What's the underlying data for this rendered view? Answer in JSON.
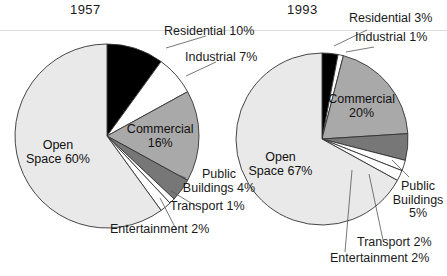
{
  "figure": {
    "background_color": "#ffffff",
    "text_color": "#1a1a1a"
  },
  "palette": {
    "residential": "#000000",
    "industrial": "#ffffff",
    "commercial": "#a9a9a9",
    "public_buildings": "#777777",
    "transport": "#ffffff",
    "entertainment": "#ffffff",
    "open_space": "#e9e9e9",
    "outline": "#333333"
  },
  "charts": {
    "left": {
      "title": "1957",
      "inner_labels": {
        "open_space_line1": "Open",
        "open_space_line2": "Space 60%",
        "commercial_line1": "Commercial",
        "commercial_line2": "16%"
      },
      "callouts": {
        "residential": "Residential 10%",
        "industrial": "Industrial 7%",
        "public_buildings_line1": "Public",
        "public_buildings_line2": "Buildings 4%",
        "transport": "Transport 1%",
        "entertainment": "Entertainment 2%"
      }
    },
    "right": {
      "title": "1993",
      "inner_labels": {
        "open_space_line1": "Open",
        "open_space_line2": "Space 67%",
        "commercial_line1": "Commercial",
        "commercial_line2": "20%"
      },
      "callouts": {
        "residential": "Residential 3%",
        "industrial": "Industrial 1%",
        "public_buildings_line1": "Public",
        "public_buildings_line2": "Buildings",
        "public_buildings_line3": "5%",
        "transport": "Transport 2%",
        "entertainment": "Entertainment 2%"
      }
    }
  },
  "chart_data": [
    {
      "type": "pie",
      "title": "1957",
      "unit": "percent",
      "start_angle_deg": 0,
      "direction": "clockwise",
      "categories": [
        "Residential",
        "Industrial",
        "Commercial",
        "Public Buildings",
        "Transport",
        "Entertainment",
        "Open Space"
      ],
      "values": [
        10,
        7,
        16,
        4,
        1,
        2,
        60
      ],
      "colors": [
        "#000000",
        "#ffffff",
        "#a9a9a9",
        "#777777",
        "#ffffff",
        "#ffffff",
        "#e9e9e9"
      ],
      "labels": [
        "Residential 10%",
        "Industrial 7%",
        "Commercial 16%",
        "Public Buildings 4%",
        "Transport 1%",
        "Entertainment 2%",
        "Open Space 60%"
      ],
      "legend": "none",
      "grid": false
    },
    {
      "type": "pie",
      "title": "1993",
      "unit": "percent",
      "start_angle_deg": 0,
      "direction": "clockwise",
      "categories": [
        "Residential",
        "Industrial",
        "Commercial",
        "Public Buildings",
        "Transport",
        "Entertainment",
        "Open Space"
      ],
      "values": [
        3,
        1,
        20,
        5,
        2,
        2,
        67
      ],
      "colors": [
        "#000000",
        "#ffffff",
        "#a9a9a9",
        "#777777",
        "#ffffff",
        "#ffffff",
        "#e9e9e9"
      ],
      "labels": [
        "Residential 3%",
        "Industrial 1%",
        "Commercial 20%",
        "Public Buildings 5%",
        "Transport 2%",
        "Entertainment 2%",
        "Open Space 67%"
      ],
      "legend": "none",
      "grid": false
    }
  ]
}
